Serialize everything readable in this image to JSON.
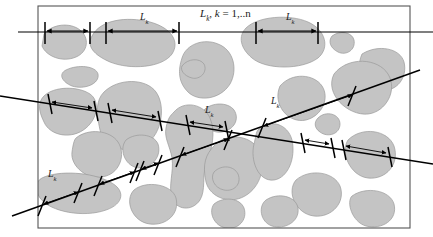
{
  "figure": {
    "kind": "stereology-intercept-length-diagram",
    "caption_title": "L_k, k = 1,..n",
    "title_parts": {
      "symbol": "L",
      "symbol_sub": "k",
      "separator": ", ",
      "index_var": "k",
      "equals": " = ",
      "range": "1,..n"
    },
    "segment_label": "L",
    "segment_label_sub": "k",
    "colors": {
      "phase_fill": "#c4c4c4",
      "phase_stroke": "#8f8f8f",
      "line_stroke": "#000000",
      "frame_stroke": "#555555",
      "background": "#ffffff",
      "text": "#1a1a1a"
    },
    "frame": {
      "x": 38,
      "y": 6,
      "width": 372,
      "height": 222
    },
    "test_lines": [
      {
        "name": "horizontal-test-line",
        "orientation": "horizontal",
        "x1": 18,
        "y1": 32,
        "x2": 433,
        "y2": 32,
        "label_count": 3
      },
      {
        "name": "descending-test-line",
        "orientation": "descending-diagonal",
        "x1": 0,
        "y1": 96,
        "x2": 433,
        "y2": 164,
        "label_count": 1
      },
      {
        "name": "ascending-test-line",
        "orientation": "ascending-diagonal",
        "x1": 12,
        "y1": 216,
        "x2": 420,
        "y2": 70,
        "label_count": 2
      }
    ],
    "measured_segments": [
      {
        "line": "horizontal",
        "start": 45,
        "end": 90,
        "labeled": false
      },
      {
        "line": "horizontal",
        "start": 106,
        "end": 179,
        "labeled": true
      },
      {
        "line": "horizontal",
        "start": 256,
        "end": 318,
        "labeled": true
      },
      {
        "line": "descending",
        "start": 50,
        "end": 96,
        "labeled": false
      },
      {
        "line": "descending",
        "start": 110,
        "end": 160,
        "labeled": false
      },
      {
        "line": "descending",
        "start": 188,
        "end": 227,
        "labeled": true
      },
      {
        "line": "descending",
        "start": 303,
        "end": 333,
        "labeled": false
      },
      {
        "line": "descending",
        "start": 344,
        "end": 390,
        "labeled": false
      },
      {
        "line": "ascending",
        "start": 42,
        "end": 78,
        "labeled": true
      },
      {
        "line": "ascending",
        "start": 98,
        "end": 134,
        "labeled": false
      },
      {
        "line": "ascending",
        "start": 140,
        "end": 158,
        "labeled": false
      },
      {
        "line": "ascending",
        "start": 180,
        "end": 228,
        "labeled": false
      },
      {
        "line": "ascending",
        "start": 262,
        "end": 352,
        "labeled": true
      }
    ],
    "labels": [
      {
        "id": "title",
        "name": "title-label",
        "x": 200,
        "y": 17,
        "kind": "title"
      },
      {
        "id": "top-mid",
        "name": "segment-label-top-mid",
        "x": 140,
        "y": 20,
        "kind": "segment"
      },
      {
        "id": "top-right",
        "name": "segment-label-top-right",
        "x": 286,
        "y": 20,
        "kind": "segment"
      },
      {
        "id": "center",
        "name": "segment-label-center",
        "x": 205,
        "y": 113,
        "kind": "segment"
      },
      {
        "id": "upper-right",
        "name": "segment-label-upper-right",
        "x": 271,
        "y": 104,
        "kind": "segment"
      },
      {
        "id": "lower-left",
        "name": "segment-label-lower-left",
        "x": 48,
        "y": 177,
        "kind": "segment"
      }
    ]
  }
}
